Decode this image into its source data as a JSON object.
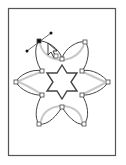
{
  "canvas": {
    "artboard": {
      "x": 8,
      "y": 8,
      "width": 108,
      "height": 148,
      "stroke": "#555555"
    },
    "colors": {
      "outline": "#444444",
      "shadow": "#c8c8c8",
      "anchor_fill": "#ffffff",
      "selected_anchor": "#111111"
    },
    "flower": {
      "center": [
        62,
        82
      ],
      "anchors": [
        {
          "id": "top-left-tip",
          "x": 39,
          "y": 41,
          "selected": true
        },
        {
          "id": "top-inner",
          "x": 62,
          "y": 59
        },
        {
          "id": "top-right-tip",
          "x": 85,
          "y": 42
        },
        {
          "id": "right-upper-inner",
          "x": 82,
          "y": 71
        },
        {
          "id": "right-tip",
          "x": 108,
          "y": 82
        },
        {
          "id": "right-lower-inner",
          "x": 82,
          "y": 95
        },
        {
          "id": "bottom-right-tip",
          "x": 84,
          "y": 124
        },
        {
          "id": "bottom-inner",
          "x": 62,
          "y": 107
        },
        {
          "id": "bottom-left-tip",
          "x": 39,
          "y": 124
        },
        {
          "id": "left-lower-inner",
          "x": 42,
          "y": 95
        },
        {
          "id": "left-tip",
          "x": 16,
          "y": 82
        },
        {
          "id": "left-upper-inner",
          "x": 42,
          "y": 71
        }
      ]
    },
    "direction_handle": {
      "anchor": [
        39,
        41
      ],
      "handle_a": [
        51,
        33
      ],
      "handle_b": [
        27,
        51
      ]
    },
    "star": {
      "center": [
        62,
        82
      ],
      "outer_radius": 17,
      "inner_radius": 10,
      "points": 6
    },
    "cursor": {
      "type": "direct-selection-arrow",
      "x": 48,
      "y": 43
    }
  }
}
